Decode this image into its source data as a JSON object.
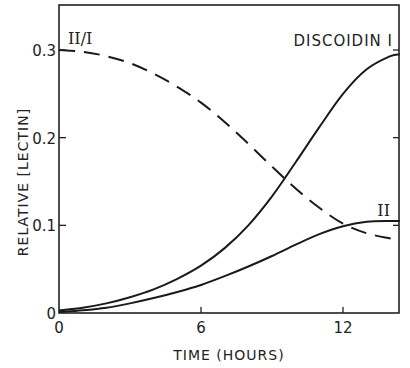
{
  "chart_data": {
    "type": "line",
    "title": "",
    "xlabel": "TIME (HOURS)",
    "ylabel": "RELATIVE [LECTIN]",
    "xlim": [
      0,
      14.4
    ],
    "ylim": [
      0,
      0.35
    ],
    "xticks": [
      0,
      6,
      12
    ],
    "xtick_labels": [
      "0",
      "6",
      "12"
    ],
    "yticks": [
      0,
      0.1,
      0.2,
      0.3
    ],
    "ytick_labels": [
      "0",
      "0.1",
      "0.2",
      "0.3"
    ],
    "grid": false,
    "legend": "inline labels",
    "x": [
      0,
      1,
      2,
      3,
      4,
      5,
      6,
      7,
      8,
      9,
      10,
      11,
      12,
      13,
      14,
      14.4
    ],
    "series": [
      {
        "name": "DISCOIDIN I",
        "style": "solid",
        "values": [
          0.003,
          0.006,
          0.011,
          0.018,
          0.027,
          0.039,
          0.054,
          0.074,
          0.1,
          0.133,
          0.172,
          0.212,
          0.25,
          0.278,
          0.293,
          0.295
        ]
      },
      {
        "name": "II",
        "style": "solid",
        "values": [
          0.001,
          0.003,
          0.006,
          0.011,
          0.017,
          0.024,
          0.032,
          0.042,
          0.053,
          0.065,
          0.078,
          0.09,
          0.099,
          0.104,
          0.105,
          0.105
        ]
      },
      {
        "name": "II/I",
        "style": "dashed",
        "values": [
          0.3,
          0.298,
          0.293,
          0.285,
          0.273,
          0.258,
          0.24,
          0.218,
          0.193,
          0.167,
          0.142,
          0.12,
          0.102,
          0.091,
          0.085,
          0.083
        ]
      }
    ]
  },
  "labels": {
    "series_discoidin_i": "DISCOIDIN I",
    "series_ii": "II",
    "series_ratio": "II/I"
  }
}
